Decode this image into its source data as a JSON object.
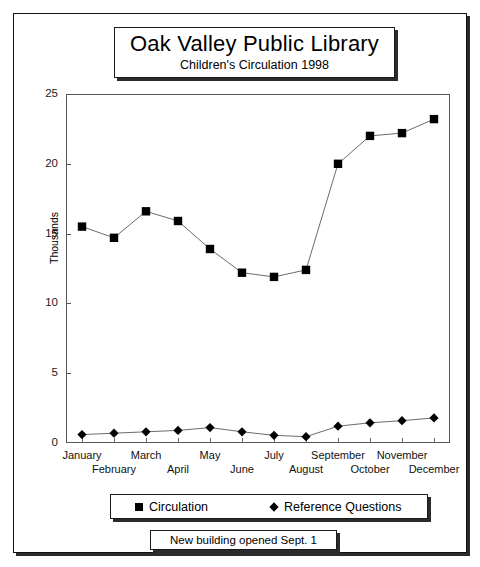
{
  "title": {
    "main": "Oak Valley Public Library",
    "subtitle": "Children's Circulation 1998"
  },
  "footnote": {
    "text": "New building opened Sept. 1"
  },
  "legend": {
    "items": [
      {
        "label": "Circulation",
        "marker": "square",
        "color": "#000000"
      },
      {
        "label": "Reference Questions",
        "marker": "diamond",
        "color": "#000000"
      }
    ]
  },
  "axis": {
    "y_title": "Thousands",
    "y_ticks": [
      "0",
      "5",
      "10",
      "15",
      "20",
      "25"
    ]
  },
  "chart_data": {
    "type": "line",
    "title": "Oak Valley Public Library",
    "subtitle": "Children's Circulation 1998",
    "xlabel": "",
    "ylabel": "Thousands",
    "ylim": [
      0,
      25
    ],
    "yticks": [
      0,
      5,
      10,
      15,
      20,
      25
    ],
    "grid": false,
    "legend_position": "bottom",
    "annotation": "New building opened Sept. 1",
    "categories": [
      "January",
      "February",
      "March",
      "April",
      "May",
      "June",
      "July",
      "August",
      "September",
      "October",
      "November",
      "December"
    ],
    "series": [
      {
        "name": "Circulation",
        "marker": "square",
        "color": "#000000",
        "values": [
          15.5,
          14.7,
          16.6,
          15.9,
          13.9,
          12.2,
          11.9,
          12.4,
          20.0,
          22.0,
          22.2,
          23.2
        ]
      },
      {
        "name": "Reference Questions",
        "marker": "diamond",
        "color": "#000000",
        "values": [
          0.6,
          0.7,
          0.8,
          0.9,
          1.1,
          0.8,
          0.55,
          0.45,
          1.2,
          1.45,
          1.6,
          1.8
        ]
      }
    ]
  }
}
